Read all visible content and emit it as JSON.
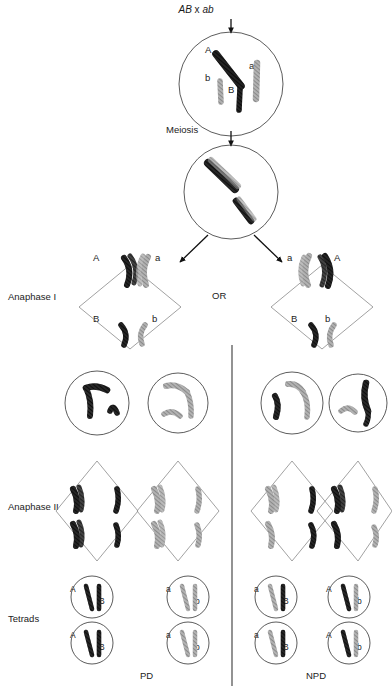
{
  "figure": {
    "title_cross": "AB x ab",
    "title_cross_left": "AB",
    "title_cross_sep": " x ",
    "title_cross_right": "ab",
    "meiosis_label": "Meiosis",
    "or_label": "OR",
    "stage_labels": {
      "anaphase_1": "Anaphase I",
      "anaphase_2": "Anaphase II",
      "tetrads": "Tetrads"
    },
    "outcome_labels": {
      "left": "PD",
      "right": "NPD"
    },
    "colors": {
      "chromosome_dark": "#2a2a2a",
      "chromosome_light": "#a8a8a8",
      "cell_outline": "#4a4a4a",
      "diamond_outline": "#8a8a8a",
      "divider": "#3a3a3a",
      "text": "#222222",
      "background": "#ffffff"
    }
  },
  "parent_cell": {
    "chromosome_labels": [
      "A",
      "b",
      "B",
      "a"
    ]
  },
  "bivalent_cell": {
    "chromosome_labels": []
  },
  "anaphase_1": {
    "left_diamond": {
      "top_left": "A",
      "top_right": "a",
      "bottom_left": "B",
      "bottom_right": "b"
    },
    "right_diamond": {
      "top_left": "a",
      "top_right": "A",
      "bottom_left": "B",
      "bottom_right": "b"
    }
  },
  "tetrads": {
    "left_group": [
      {
        "left": "A",
        "right": "B"
      },
      {
        "left": "a",
        "right": "b"
      },
      {
        "left": "A",
        "right": "B"
      },
      {
        "left": "a",
        "right": "b"
      }
    ],
    "right_group": [
      {
        "left": "a",
        "right": "B"
      },
      {
        "left": "A",
        "right": "b"
      },
      {
        "left": "a",
        "right": "B"
      },
      {
        "left": "A",
        "right": "b"
      }
    ]
  }
}
